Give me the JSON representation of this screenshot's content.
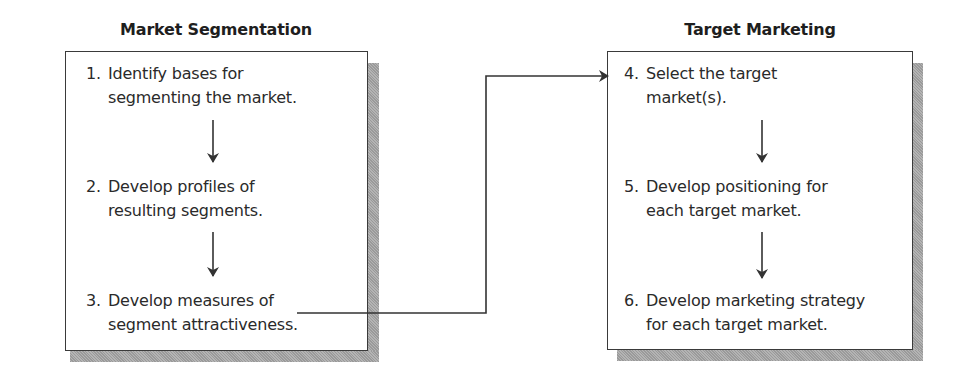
{
  "diagram": {
    "left_panel": {
      "title": "Market Segmentation",
      "steps": [
        {
          "number": "1.",
          "line1": "Identify bases for",
          "line2": "segmenting the market."
        },
        {
          "number": "2.",
          "line1": "Develop profiles of",
          "line2": "resulting segments."
        },
        {
          "number": "3.",
          "line1": "Develop measures of",
          "line2": "segment attractiveness."
        }
      ]
    },
    "right_panel": {
      "title": "Target Marketing",
      "steps": [
        {
          "number": "4.",
          "line1": "Select the target",
          "line2": "market(s)."
        },
        {
          "number": "5.",
          "line1": "Develop positioning for",
          "line2": "each target market."
        },
        {
          "number": "6.",
          "line1": "Develop marketing strategy",
          "line2": "for each target market."
        }
      ]
    },
    "connectors": [
      {
        "from": "step-1",
        "to": "step-2"
      },
      {
        "from": "step-2",
        "to": "step-3"
      },
      {
        "from": "step-3",
        "to": "step-4"
      },
      {
        "from": "step-4",
        "to": "step-5"
      },
      {
        "from": "step-5",
        "to": "step-6"
      }
    ],
    "colors": {
      "line": "#333333",
      "shadow": "#a8a8a8",
      "box_fill": "#ffffff"
    }
  }
}
